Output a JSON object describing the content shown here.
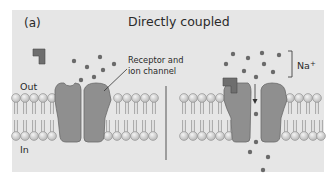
{
  "figure": {
    "panel_label": "(a)",
    "title": "Directly coupled",
    "labels": {
      "outside": "Out",
      "inside": "In",
      "receptor_line1": "Receptor and",
      "receptor_line2": "ion channel",
      "ion_base": "Na",
      "ion_charge": "+"
    },
    "colors": {
      "panel_background": "#e6e6e6",
      "protein_fill": "#8f8f8f",
      "ligand_fill": "#6e6e6e",
      "ion_dot": "#6a6a6a",
      "lipid_head": "#e2e2e2"
    },
    "states": [
      {
        "name": "closed",
        "description": "Ligand unbound, channel closed"
      },
      {
        "name": "open",
        "description": "Ligand bound, Na+ ions flow inward through channel"
      }
    ]
  }
}
